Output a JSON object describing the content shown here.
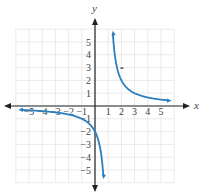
{
  "chart_data": {
    "type": "line",
    "title": "",
    "xlabel": "x",
    "ylabel": "y",
    "xlim": [
      -6,
      6
    ],
    "ylim": [
      -6,
      6
    ],
    "grid": true,
    "x_ticks": [
      "−5",
      "−4",
      "−3",
      "−2",
      "−1",
      "1",
      "2",
      "3",
      "4",
      "5"
    ],
    "y_ticks": [
      "5",
      "4",
      "3",
      "2",
      "1",
      "−1",
      "−2",
      "−3",
      "−4",
      "−5"
    ],
    "series": [
      {
        "name": "left branch",
        "function": "2/(x-1)",
        "x": [
          -5.5,
          -4,
          -3,
          -2,
          -1,
          0,
          0.6
        ],
        "y": [
          -0.31,
          -0.4,
          -0.5,
          -0.67,
          -1,
          -2,
          -5
        ]
      },
      {
        "name": "right branch",
        "function": "2/(x-1)",
        "x": [
          1.35,
          1.5,
          2,
          3,
          4,
          5,
          5.5
        ],
        "y": [
          5.7,
          4,
          2,
          1,
          0.67,
          0.5,
          0.44
        ]
      }
    ],
    "asymptotes": {
      "vertical": 1,
      "horizontal": 0
    },
    "color": "#2a7fc1"
  }
}
